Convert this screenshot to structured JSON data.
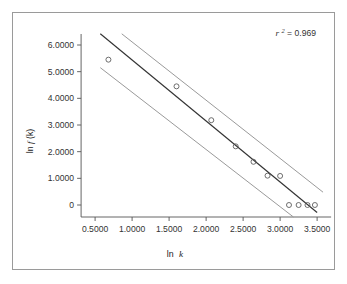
{
  "figure": {
    "border_color": "#9a9a9a",
    "background": "#ffffff"
  },
  "annotation": {
    "r_symbol": "r",
    "r_exponent": "2",
    "r_equals": " = 0.969",
    "full_text": "r2 = 0.969",
    "value": 0.969
  },
  "chart_data": {
    "type": "scatter",
    "title": "",
    "subtitle": "",
    "xlabel": "ln k",
    "ylabel": "ln f(k)",
    "xlabel_plain": "ln",
    "xlabel_italic": "k",
    "ylabel_plain_a": "ln ",
    "ylabel_italic": "f",
    "ylabel_plain_b": "(k)",
    "xlim": [
      0.35,
      3.62
    ],
    "ylim": [
      -0.45,
      6.45
    ],
    "xticks": [
      0.5,
      1.0,
      1.5,
      2.0,
      2.5,
      3.0,
      3.5
    ],
    "xtick_labels": [
      "0.5000",
      "1.0000",
      "1.5000",
      "2.0000",
      "2.5000",
      "3.0000",
      "3.5000"
    ],
    "yticks": [
      0,
      1,
      2,
      3,
      4,
      5,
      6
    ],
    "ytick_labels": [
      "0",
      "1.0000",
      "2.0000",
      "3.0000",
      "4.0000",
      "5.0000",
      "6.0000"
    ],
    "grid": false,
    "legend": false,
    "legend_position": "none",
    "marker": "open-circle",
    "marker_color": "#555555",
    "points": [
      {
        "x": 0.68,
        "y": 5.45
      },
      {
        "x": 1.6,
        "y": 4.45
      },
      {
        "x": 2.07,
        "y": 3.18
      },
      {
        "x": 2.4,
        "y": 2.2
      },
      {
        "x": 2.64,
        "y": 1.62
      },
      {
        "x": 2.83,
        "y": 1.1
      },
      {
        "x": 3.0,
        "y": 1.09
      },
      {
        "x": 3.12,
        "y": 0.0
      },
      {
        "x": 3.25,
        "y": 0.0
      },
      {
        "x": 3.37,
        "y": 0.0
      },
      {
        "x": 3.47,
        "y": 0.0
      }
    ],
    "series": [
      {
        "name": "regression-line",
        "type": "line",
        "color": "#333333",
        "x": [
          0.57,
          3.5
        ],
        "y": [
          6.42,
          -0.28
        ]
      },
      {
        "name": "upper-confidence-band",
        "type": "line",
        "color": "#9a9a9a",
        "x": [
          0.86,
          3.58
        ],
        "y": [
          6.42,
          0.48
        ]
      },
      {
        "name": "lower-confidence-band",
        "type": "line",
        "color": "#9a9a9a",
        "x": [
          0.57,
          3.18
        ],
        "y": [
          5.15,
          -0.45
        ]
      }
    ]
  }
}
